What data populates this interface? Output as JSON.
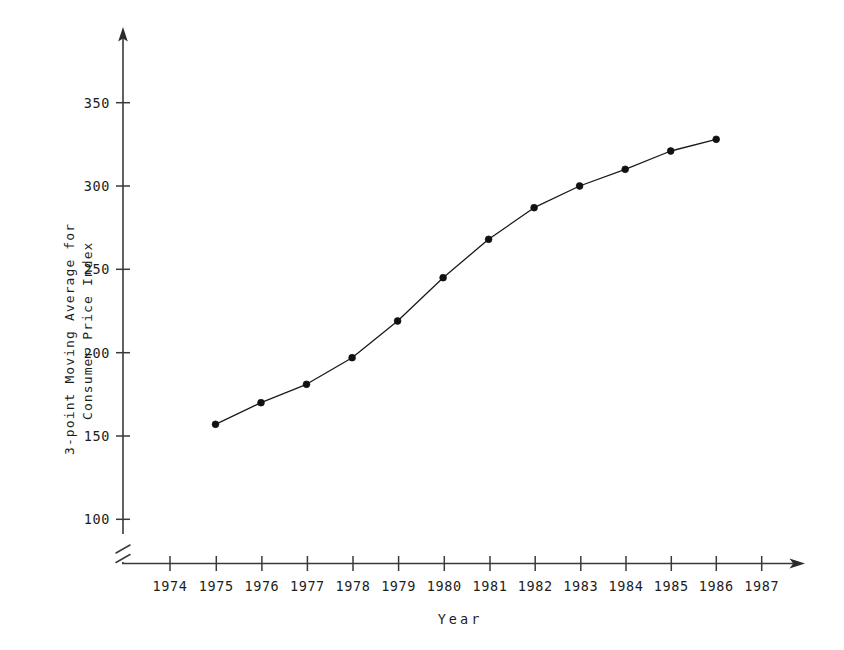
{
  "chart_data": {
    "type": "line",
    "title": "",
    "subtitle": "",
    "xlabel": "Year",
    "ylabel": "3-point Moving Average for Consumer Price Index",
    "ylabel_lines": [
      "3-point Moving Average for",
      "Consumer Price Index"
    ],
    "x": [
      1975,
      1976,
      1977,
      1978,
      1979,
      1980,
      1981,
      1982,
      1983,
      1984,
      1985,
      1986
    ],
    "values": [
      157,
      170,
      181,
      197,
      219,
      245,
      268,
      287,
      300,
      310,
      321,
      328
    ],
    "series": [
      {
        "name": "3-point Moving Average for Consumer Price Index",
        "values": [
          157,
          170,
          181,
          197,
          219,
          245,
          268,
          287,
          300,
          310,
          321,
          328
        ]
      }
    ],
    "xticks": [
      1974,
      1975,
      1976,
      1977,
      1978,
      1979,
      1980,
      1981,
      1982,
      1983,
      1984,
      1985,
      1986,
      1987
    ],
    "xtick_labels": [
      "1974",
      "1975",
      "1976",
      "1977",
      "1978",
      "1979",
      "1980",
      "1981",
      "1982",
      "1983",
      "1984",
      "1985",
      "1986",
      "1987"
    ],
    "yticks": [
      100,
      150,
      200,
      250,
      300,
      350
    ],
    "ytick_labels": [
      "100",
      "150",
      "200",
      "250",
      "300",
      "350"
    ],
    "xlim": [
      1973.4,
      1988.0
    ],
    "ylim": [
      82,
      372
    ],
    "grid": false,
    "legend": false,
    "legend_position": "none",
    "y_axis_break": true,
    "marker": "filled-circle",
    "line_color": "#1a1a1a",
    "marker_color": "#111111",
    "axis_color": "#3a3a3a",
    "background_color": "#ffffff"
  },
  "axes": {
    "y_axis_name": "y-axis",
    "x_axis_name": "x-axis",
    "break_symbol": "axis-break"
  }
}
